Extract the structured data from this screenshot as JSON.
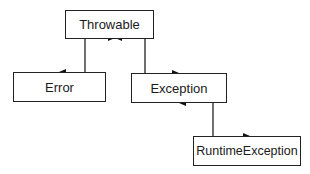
{
  "diagram": {
    "type": "class-hierarchy",
    "nodes": [
      {
        "id": "throwable",
        "label": "Throwable"
      },
      {
        "id": "error",
        "label": "Error"
      },
      {
        "id": "exception",
        "label": "Exception"
      },
      {
        "id": "runtime_exception",
        "label": "RuntimeException"
      }
    ],
    "edges": [
      {
        "from": "error",
        "to": "throwable"
      },
      {
        "from": "exception",
        "to": "throwable"
      },
      {
        "from": "runtime_exception",
        "to": "exception"
      }
    ]
  }
}
